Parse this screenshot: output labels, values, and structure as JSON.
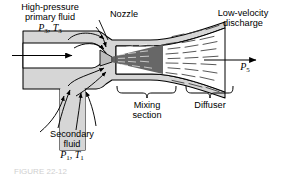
{
  "figure": {
    "type": "ejector-jet-pump-schematic",
    "body_fill": "#d6d6d6",
    "jet_core_fill": "#4a4a4a",
    "outline_color": "#000000",
    "background": "#ffffff"
  },
  "labels": {
    "primary_inlet": {
      "line1": "High-pressure",
      "line2": "primary fluid",
      "state_symbol": "P",
      "state_sub1": "3",
      "state_sep": ", ",
      "state_symbol2": "T",
      "state_sub2": "3"
    },
    "nozzle": "Nozzle",
    "discharge": {
      "line1": "Low-velocity",
      "line2": "discharge",
      "state_symbol": "P",
      "state_sub": "5"
    },
    "mixing_section": {
      "line1": "Mixing",
      "line2": "section"
    },
    "diffuser": "Diffuser",
    "secondary_inlet": {
      "line1": "Secondary",
      "line2": "fluid",
      "state_symbol": "P",
      "state_sub1": "1",
      "state_sep": ", ",
      "state_symbol2": "T",
      "state_sub2": "1"
    }
  },
  "caption": {
    "text": "FIGURE 22-12"
  }
}
